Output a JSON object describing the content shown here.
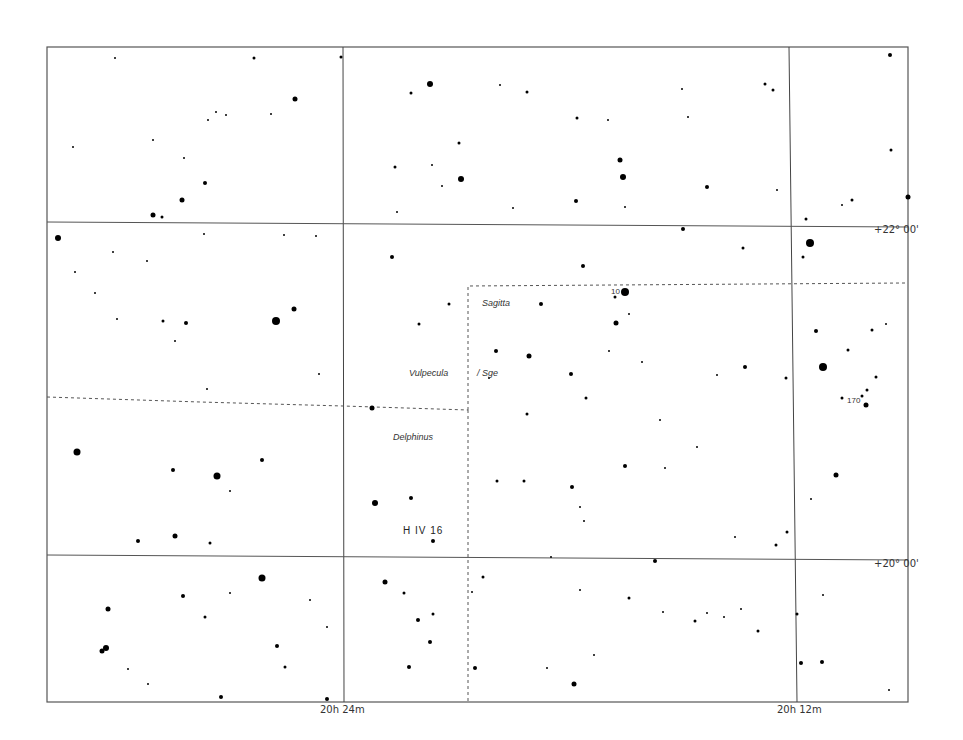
{
  "chart_title": "",
  "frame": {
    "x1": 47,
    "y1": 47,
    "x2": 908,
    "y2": 702
  },
  "grid": {
    "ra_lines": [
      {
        "label": "20h 24m",
        "x_top": 343,
        "x_bottom": 344,
        "label_x": 320
      },
      {
        "label": "20h 12m",
        "x_top": 789,
        "x_bottom": 797,
        "label_x": 778
      }
    ],
    "dec_lines": [
      {
        "label": "+22° 00'",
        "y_left": 222,
        "y_right": 227,
        "label_y": 229
      },
      {
        "label": "+20° 00'",
        "y_left": 555,
        "y_right": 560,
        "label_y": 563
      }
    ]
  },
  "constellation_boundaries": [
    {
      "points": [
        [
          47,
          397
        ],
        [
          200,
          402
        ],
        [
          343,
          406
        ],
        [
          468,
          410
        ]
      ]
    },
    {
      "points": [
        [
          468,
          410
        ],
        [
          468,
          286
        ],
        [
          905,
          283
        ]
      ]
    },
    {
      "points": [
        [
          468,
          410
        ],
        [
          468,
          702
        ]
      ]
    }
  ],
  "labels": {
    "constellations": [
      {
        "name": "Sagitta",
        "x": 482,
        "y": 303
      },
      {
        "name": "Vulpecula",
        "x": 409,
        "y": 373
      },
      {
        "name": "Sge",
        "prefix": "/",
        "x": 478,
        "y": 373
      },
      {
        "name": "Delphinus",
        "x": 393,
        "y": 437
      }
    ],
    "stars": [
      {
        "name": "10",
        "x": 611,
        "y": 292
      },
      {
        "name": "170",
        "x": 848,
        "y": 401
      }
    ],
    "objects": [
      {
        "name": "H IV 16",
        "x": 403,
        "y": 531
      }
    ],
    "axis_ra": [
      "20h 24m",
      "20h 12m"
    ],
    "axis_dec": [
      "+22° 00'",
      "+20° 00'"
    ]
  },
  "stars": [
    [
      115,
      58,
      1
    ],
    [
      254,
      58,
      1.5
    ],
    [
      341,
      57,
      1.5
    ],
    [
      890,
      55,
      2
    ],
    [
      295,
      99,
      2.5
    ],
    [
      411,
      93,
      1.5
    ],
    [
      430,
      84,
      3
    ],
    [
      500,
      85,
      1
    ],
    [
      527,
      92,
      1.5
    ],
    [
      682,
      89,
      1
    ],
    [
      765,
      84,
      1.5
    ],
    [
      773,
      90,
      1.5
    ],
    [
      208,
      120,
      1
    ],
    [
      216,
      112,
      1
    ],
    [
      577,
      118,
      1.5
    ],
    [
      688,
      117,
      1
    ],
    [
      608,
      120,
      1
    ],
    [
      153,
      140,
      1
    ],
    [
      184,
      158,
      1
    ],
    [
      271,
      114,
      1
    ],
    [
      226,
      115,
      1
    ],
    [
      73,
      147,
      1
    ],
    [
      891,
      150,
      1.5
    ],
    [
      620,
      160,
      2.5
    ],
    [
      623,
      177,
      3
    ],
    [
      461,
      179,
      3
    ],
    [
      395,
      167,
      1.5
    ],
    [
      432,
      165,
      1
    ],
    [
      459,
      143,
      1.5
    ],
    [
      205,
      183,
      2
    ],
    [
      182,
      200,
      2.5
    ],
    [
      153,
      215,
      2.5
    ],
    [
      162,
      217,
      1.5
    ],
    [
      707,
      187,
      2
    ],
    [
      777,
      190,
      1
    ],
    [
      442,
      186,
      1
    ],
    [
      576,
      201,
      2
    ],
    [
      625,
      207,
      1
    ],
    [
      852,
      200,
      1.5
    ],
    [
      842,
      205,
      1
    ],
    [
      908,
      197,
      2.5
    ],
    [
      58,
      238,
      3
    ],
    [
      113,
      252,
      1
    ],
    [
      204,
      234,
      1
    ],
    [
      284,
      235,
      1
    ],
    [
      397,
      212,
      1
    ],
    [
      513,
      208,
      1
    ],
    [
      683,
      229,
      2
    ],
    [
      806,
      219,
      1.5
    ],
    [
      810,
      243,
      4
    ],
    [
      803,
      257,
      1.5
    ],
    [
      743,
      248,
      1.5
    ],
    [
      392,
      257,
      2
    ],
    [
      583,
      266,
      2
    ],
    [
      75,
      272,
      1
    ],
    [
      147,
      261,
      1
    ],
    [
      316,
      236,
      1
    ],
    [
      294,
      309,
      2.5
    ],
    [
      276,
      321,
      4
    ],
    [
      186,
      323,
      2
    ],
    [
      163,
      321,
      1.5
    ],
    [
      175,
      341,
      1
    ],
    [
      419,
      324,
      1.5
    ],
    [
      449,
      304,
      1.5
    ],
    [
      541,
      304,
      2
    ],
    [
      615,
      297,
      1.5
    ],
    [
      625,
      292,
      4
    ],
    [
      616,
      323,
      2.5
    ],
    [
      629,
      314,
      1
    ],
    [
      816,
      331,
      2
    ],
    [
      872,
      330,
      1.5
    ],
    [
      886,
      324,
      1
    ],
    [
      848,
      350,
      1.5
    ],
    [
      823,
      367,
      4
    ],
    [
      876,
      377,
      1.5
    ],
    [
      867,
      390,
      1.5
    ],
    [
      862,
      396,
      1.5
    ],
    [
      842,
      398,
      1.5
    ],
    [
      866,
      405,
      2.5
    ],
    [
      496,
      351,
      2
    ],
    [
      529,
      356,
      2.5
    ],
    [
      609,
      351,
      1
    ],
    [
      571,
      374,
      2
    ],
    [
      745,
      367,
      2
    ],
    [
      786,
      378,
      1.5
    ],
    [
      717,
      375,
      1
    ],
    [
      642,
      362,
      1
    ],
    [
      489,
      378,
      1
    ],
    [
      319,
      374,
      1
    ],
    [
      95,
      293,
      1
    ],
    [
      117,
      319,
      1
    ],
    [
      207,
      389,
      1
    ],
    [
      372,
      408,
      2.5
    ],
    [
      77,
      452,
      3.5
    ],
    [
      173,
      470,
      2
    ],
    [
      217,
      476,
      3.5
    ],
    [
      262,
      460,
      2
    ],
    [
      230,
      491,
      1
    ],
    [
      586,
      398,
      1.5
    ],
    [
      527,
      414,
      1.5
    ],
    [
      660,
      420,
      1
    ],
    [
      625,
      466,
      2
    ],
    [
      524,
      481,
      1.5
    ],
    [
      497,
      481,
      1.5
    ],
    [
      572,
      487,
      2
    ],
    [
      697,
      447,
      1
    ],
    [
      665,
      468,
      1
    ],
    [
      836,
      475,
      2.5
    ],
    [
      811,
      499,
      1
    ],
    [
      584,
      521,
      1
    ],
    [
      580,
      507,
      1
    ],
    [
      375,
      503,
      3
    ],
    [
      411,
      498,
      2
    ],
    [
      138,
      541,
      2
    ],
    [
      175,
      536,
      2.5
    ],
    [
      210,
      543,
      1.5
    ],
    [
      433,
      541,
      2
    ],
    [
      776,
      545,
      1.5
    ],
    [
      787,
      532,
      1.5
    ],
    [
      735,
      537,
      1
    ],
    [
      551,
      557,
      1
    ],
    [
      655,
      561,
      2
    ],
    [
      262,
      578,
      3.5
    ],
    [
      183,
      596,
      2
    ],
    [
      230,
      593,
      1
    ],
    [
      108,
      609,
      2.5
    ],
    [
      205,
      617,
      1.5
    ],
    [
      310,
      600,
      1
    ],
    [
      385,
      582,
      2.5
    ],
    [
      404,
      593,
      1.5
    ],
    [
      433,
      614,
      1.5
    ],
    [
      418,
      620,
      2
    ],
    [
      430,
      642,
      2
    ],
    [
      483,
      577,
      1.5
    ],
    [
      472,
      592,
      1
    ],
    [
      580,
      590,
      1
    ],
    [
      629,
      598,
      1.5
    ],
    [
      663,
      612,
      1
    ],
    [
      695,
      621,
      1.5
    ],
    [
      707,
      613,
      1
    ],
    [
      724,
      617,
      1
    ],
    [
      741,
      609,
      1
    ],
    [
      758,
      631,
      1.5
    ],
    [
      797,
      614,
      1.5
    ],
    [
      823,
      595,
      1
    ],
    [
      106,
      648,
      3
    ],
    [
      102,
      651,
      2.5
    ],
    [
      128,
      669,
      1
    ],
    [
      277,
      646,
      2
    ],
    [
      285,
      667,
      1.5
    ],
    [
      327,
      627,
      1
    ],
    [
      409,
      667,
      2
    ],
    [
      475,
      668,
      2
    ],
    [
      574,
      684,
      2.5
    ],
    [
      547,
      668,
      1
    ],
    [
      594,
      655,
      1
    ],
    [
      801,
      663,
      2
    ],
    [
      822,
      662,
      2
    ],
    [
      889,
      690,
      1
    ],
    [
      221,
      697,
      2
    ],
    [
      327,
      699,
      2
    ],
    [
      148,
      684,
      1
    ]
  ]
}
